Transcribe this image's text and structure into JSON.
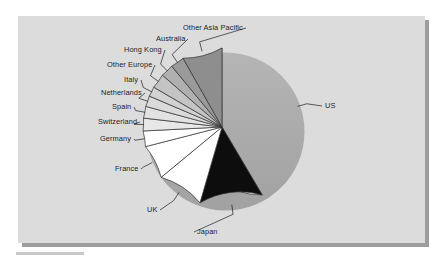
{
  "figure": {
    "background_color": "#dcdcdc",
    "page_color": "#ffffff",
    "shadow_color": "#8c8c8c"
  },
  "chart_data": {
    "type": "pie",
    "title": "",
    "subtitle": "",
    "xlabel": "",
    "ylabel": "",
    "legend_position": "callout-labels",
    "grid": false,
    "start_angle_deg": 90,
    "direction": "clockwise",
    "center": {
      "x": 222,
      "y": 127
    },
    "radius": 79,
    "categories": [
      "US",
      "Japan",
      "UK",
      "France",
      "Germany",
      "Switzerland",
      "Spain",
      "Netherlands",
      "Italy",
      "Other Europe",
      "Hong Kong",
      "Australia",
      "Other Asia Pacific"
    ],
    "values": [
      41.5,
      13.0,
      9.5,
      7.0,
      3.2,
      2.6,
      2.4,
      2.2,
      2.0,
      3.0,
      2.6,
      2.8,
      8.2
    ],
    "value_unit": "%",
    "colors": [
      "#ffffff",
      "#0d0d0d",
      "#ffffff",
      "#ffffff",
      "#ffffff",
      "#e8e8e8",
      "#e2e2e2",
      "#dadada",
      "#d2d2d2",
      "#c4c4c4",
      "#b0b0b0",
      "#9a9a9a",
      "#8e8e8e"
    ],
    "slice_edge_color": "#303030",
    "labels": [
      {
        "name": "US",
        "text": "US",
        "side": "right",
        "x": 325,
        "y": 106
      },
      {
        "name": "Japan",
        "text": "Japan",
        "side": "right",
        "x": 197,
        "y": 232
      },
      {
        "name": "UK",
        "text": "UK",
        "side": "left",
        "x": 157,
        "y": 210
      },
      {
        "name": "France",
        "text": "France",
        "side": "left",
        "x": 138,
        "y": 169
      },
      {
        "name": "Germany",
        "text": "Germany",
        "side": "left",
        "x": 131,
        "y": 139
      },
      {
        "name": "Switzerland",
        "text": "Switzerland",
        "side": "left",
        "x": 137,
        "y": 122
      },
      {
        "name": "Spain",
        "text": "Spain",
        "side": "left",
        "x": 131,
        "y": 107
      },
      {
        "name": "Netherlands",
        "text": "Netherlands",
        "side": "left",
        "x": 142,
        "y": 93
      },
      {
        "name": "Italy",
        "text": "Italy",
        "side": "left",
        "x": 138,
        "y": 80
      },
      {
        "name": "Other Europe",
        "text": "Other Europe",
        "side": "left",
        "x": 152,
        "y": 65
      },
      {
        "name": "Hong Kong",
        "text": "Hong Kong",
        "side": "left",
        "x": 162,
        "y": 50
      },
      {
        "name": "Australia",
        "text": "Australia",
        "side": "left",
        "x": 185,
        "y": 39
      },
      {
        "name": "Other Asia Pacific",
        "text": "Other Asia Pacific",
        "side": "left",
        "x": 243,
        "y": 28
      }
    ]
  }
}
